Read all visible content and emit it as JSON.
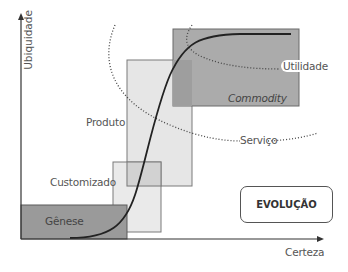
{
  "axes": {
    "y_label": "Ubiquidade",
    "x_label": "Certeza"
  },
  "stages": [
    {
      "name": "Gênese",
      "fill": "#9a9a9a"
    },
    {
      "name": "Customizado",
      "fill": "#e4e4e4"
    },
    {
      "name": "Produto",
      "fill": "#e4e4e4"
    },
    {
      "name": "Commodity",
      "fill": "#a8a8a8"
    }
  ],
  "regions": {
    "utility": "Utilidade",
    "service": "Serviço"
  },
  "badge": "EVOLUÇÃO"
}
